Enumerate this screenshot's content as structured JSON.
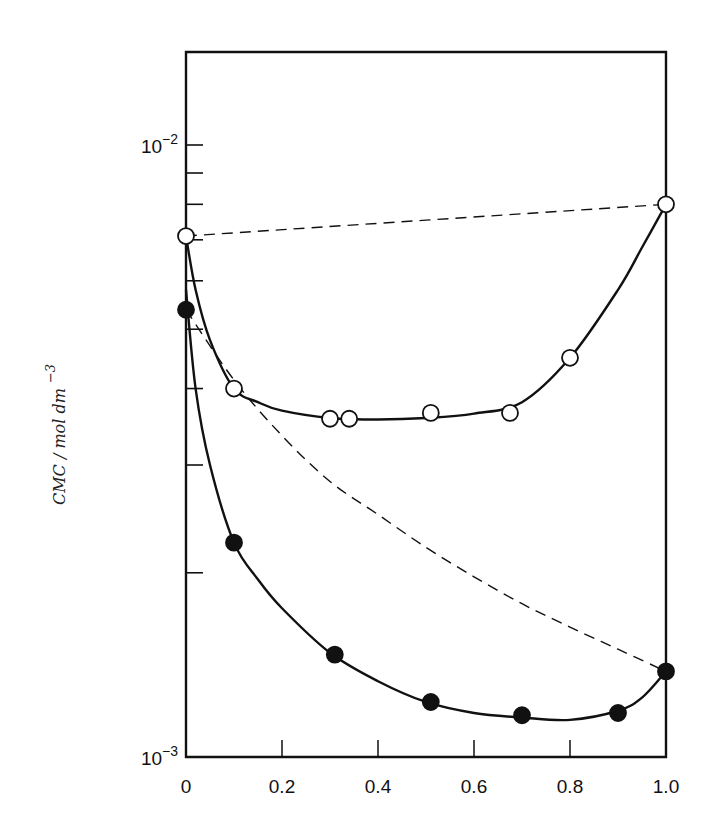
{
  "chart_data": {
    "type": "line",
    "title": "",
    "xlabel": "",
    "ylabel": "CMC / mol dm^-3",
    "ylabel_parts": {
      "main": "CMC / mol  dm",
      "sup": "−3"
    },
    "yscale": "log",
    "xlim": [
      0,
      1.0
    ],
    "ylim": [
      0.001,
      0.0145
    ],
    "grid": false,
    "legend": null,
    "x_ticks": [
      "0",
      "0.2",
      "0.4",
      "0.6",
      "0.8",
      "1.0"
    ],
    "x_tick_values": [
      0,
      0.2,
      0.4,
      0.6,
      0.8,
      1.0
    ],
    "y_tick_labels": [
      {
        "value": 0.01,
        "base": "10",
        "exp": "-2"
      },
      {
        "value": 0.001,
        "base": "10",
        "exp": "-3"
      }
    ],
    "y_minor_ticks": [
      0.002,
      0.003,
      0.004,
      0.005,
      0.006,
      0.007,
      0.008,
      0.009,
      0.01
    ],
    "series": [
      {
        "name": "open circles (experimental, upper system)",
        "marker": "open-circle",
        "line": "solid",
        "x": [
          0,
          0.1,
          0.3,
          0.34,
          0.51,
          0.675,
          0.8,
          1.0
        ],
        "values": [
          0.0071,
          0.004,
          0.00357,
          0.00357,
          0.00365,
          0.00365,
          0.00449,
          0.008
        ]
      },
      {
        "name": "filled circles (experimental, lower system)",
        "marker": "filled-circle",
        "line": "solid",
        "x": [
          0,
          0.1,
          0.31,
          0.51,
          0.7,
          0.9,
          1.0
        ],
        "values": [
          0.00538,
          0.00224,
          0.00147,
          0.00123,
          0.00117,
          0.00118,
          0.00138
        ]
      },
      {
        "name": "ideal mixing line (upper)",
        "marker": "none",
        "line": "dashed",
        "x": [
          0,
          1.0
        ],
        "values": [
          0.0071,
          0.008
        ]
      },
      {
        "name": "ideal mixing curve (lower)",
        "marker": "none",
        "line": "dashed",
        "x": [
          0,
          0.1,
          0.2,
          0.3,
          0.4,
          0.5,
          0.6,
          0.7,
          0.8,
          0.9,
          1.0
        ],
        "values": [
          0.00538,
          0.00413,
          0.00335,
          0.00282,
          0.00249,
          0.0022,
          0.00197,
          0.00178,
          0.00163,
          0.0015,
          0.00138
        ]
      }
    ],
    "solid_curves": {
      "upper": {
        "x": [
          0,
          0.02,
          0.05,
          0.1,
          0.15,
          0.2,
          0.3,
          0.4,
          0.5,
          0.6,
          0.7,
          0.8,
          0.9,
          0.95,
          1.0
        ],
        "values": [
          0.0071,
          0.0058,
          0.0048,
          0.004,
          0.0038,
          0.00368,
          0.00358,
          0.00356,
          0.00358,
          0.00364,
          0.0038,
          0.00449,
          0.0058,
          0.0068,
          0.008
        ]
      },
      "lower": {
        "x": [
          0,
          0.02,
          0.05,
          0.1,
          0.15,
          0.2,
          0.3,
          0.4,
          0.5,
          0.6,
          0.7,
          0.8,
          0.9,
          0.95,
          1.0
        ],
        "values": [
          0.0058,
          0.004,
          0.003,
          0.00224,
          0.00195,
          0.00175,
          0.00148,
          0.00133,
          0.00123,
          0.00118,
          0.00116,
          0.00115,
          0.00119,
          0.00125,
          0.00138
        ]
      }
    },
    "colors": {
      "line": "#111111",
      "background": "#ffffff",
      "marker_fill": "#ffffff"
    }
  }
}
